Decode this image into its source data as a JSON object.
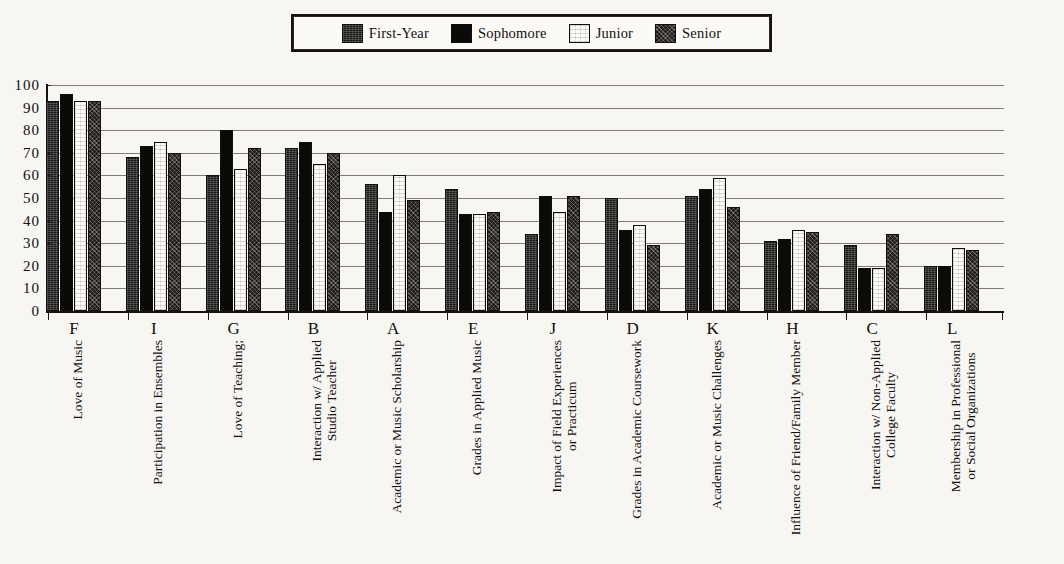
{
  "legend": {
    "items": [
      {
        "label": "First-Year",
        "key": "firstyear",
        "swatch": "dark-hatched-swatch"
      },
      {
        "label": "Sophomore",
        "key": "sophomore",
        "swatch": "solid-black-swatch"
      },
      {
        "label": "Junior",
        "key": "junior",
        "swatch": "white-swatch"
      },
      {
        "label": "Senior",
        "key": "senior",
        "swatch": "dark-textured-swatch"
      }
    ]
  },
  "axis": {
    "y_ticks": [
      "100",
      "90",
      "80",
      "70",
      "60",
      "50",
      "40",
      "30",
      "20",
      "10",
      "0"
    ]
  },
  "chart_data": {
    "type": "bar",
    "title": "",
    "xlabel": "",
    "ylabel": "",
    "ylim": [
      0,
      100
    ],
    "ytick_step": 10,
    "grid": true,
    "legend_position": "top-center",
    "categories": [
      "F",
      "I",
      "G",
      "B",
      "A",
      "E",
      "J",
      "D",
      "K",
      "H",
      "C",
      "L"
    ],
    "category_labels": [
      "Love of Music",
      "Participation in Ensembles",
      "Love of Teaching;",
      "Interaction w/ Applied|Studio Teacher",
      "Academic or Music Scholarship",
      "Grades in Applied Music",
      "Impact of Field Experiences|or Practicum",
      "Grades in Academic Coursework",
      "Academic or Music Challenges",
      "Influence of Friend/Family Member",
      "Interaction w/ Non-Applied|College Faculty",
      "Membership in Professional|or Social Organizations"
    ],
    "series": [
      {
        "name": "First-Year",
        "key": "firstyear",
        "values": [
          93,
          68,
          60,
          72,
          56,
          54,
          34,
          50,
          51,
          31,
          29,
          20
        ]
      },
      {
        "name": "Sophomore",
        "key": "sophomore",
        "values": [
          96,
          73,
          80,
          75,
          44,
          43,
          51,
          36,
          54,
          32,
          19,
          20
        ]
      },
      {
        "name": "Junior",
        "key": "junior",
        "values": [
          93,
          75,
          63,
          65,
          60,
          43,
          44,
          38,
          59,
          36,
          19,
          28
        ]
      },
      {
        "name": "Senior",
        "key": "senior",
        "values": [
          93,
          70,
          72,
          70,
          49,
          44,
          51,
          29,
          46,
          35,
          34,
          27
        ]
      }
    ]
  }
}
